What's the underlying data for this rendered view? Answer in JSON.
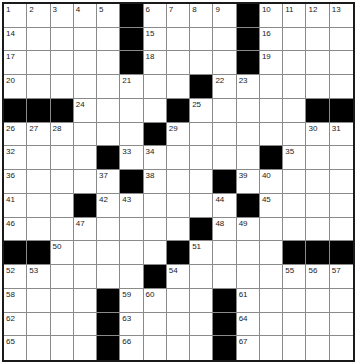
{
  "puzzle": {
    "size": 15,
    "colors": {
      "black": "#000000",
      "white": "#ffffff",
      "grid_line": "#8a8a8a",
      "border": "#1a1a1a"
    },
    "rows": [
      [
        "1",
        "2",
        "3",
        "4",
        "5",
        "#",
        "6",
        "7",
        "8",
        "9",
        "#",
        "10",
        "11",
        "12",
        "13"
      ],
      [
        "14",
        ".",
        ".",
        ".",
        ".",
        "#",
        "15",
        ".",
        ".",
        ".",
        "#",
        "16",
        ".",
        ".",
        "."
      ],
      [
        "17",
        ".",
        ".",
        ".",
        ".",
        "#",
        "18",
        ".",
        ".",
        ".",
        "#",
        "19",
        ".",
        ".",
        "."
      ],
      [
        "20",
        ".",
        ".",
        ".",
        ".",
        "21",
        ".",
        ".",
        "#",
        "22",
        "23",
        ".",
        ".",
        ".",
        "."
      ],
      [
        "#",
        "#",
        "#",
        "24",
        ".",
        ".",
        ".",
        "#",
        "25",
        ".",
        ".",
        ".",
        ".",
        "#",
        "#"
      ],
      [
        "26",
        "27",
        "28",
        ".",
        ".",
        ".",
        "#",
        "29",
        ".",
        ".",
        ".",
        ".",
        ".",
        "30",
        "31"
      ],
      [
        "32",
        ".",
        ".",
        ".",
        "#",
        "33",
        "34",
        ".",
        ".",
        ".",
        ".",
        "#",
        "35",
        ".",
        "."
      ],
      [
        "36",
        ".",
        ".",
        ".",
        "37",
        "#",
        "38",
        ".",
        ".",
        "#",
        "39",
        "40",
        ".",
        ".",
        "."
      ],
      [
        "41",
        ".",
        ".",
        "#",
        "42",
        "43",
        ".",
        ".",
        ".",
        "44",
        "#",
        "45",
        ".",
        ".",
        "."
      ],
      [
        "46",
        ".",
        ".",
        "47",
        ".",
        ".",
        ".",
        ".",
        "#",
        "48",
        "49",
        ".",
        ".",
        ".",
        "."
      ],
      [
        "#",
        "#",
        "50",
        ".",
        ".",
        ".",
        ".",
        "#",
        "51",
        ".",
        ".",
        ".",
        "#",
        "#",
        "#"
      ],
      [
        "52",
        "53",
        ".",
        ".",
        ".",
        ".",
        "#",
        "54",
        ".",
        ".",
        ".",
        ".",
        "55",
        "56",
        "57"
      ],
      [
        "58",
        ".",
        ".",
        ".",
        "#",
        "59",
        "60",
        ".",
        ".",
        "#",
        "61",
        ".",
        ".",
        ".",
        "."
      ],
      [
        "62",
        ".",
        ".",
        ".",
        "#",
        "63",
        ".",
        ".",
        ".",
        "#",
        "64",
        ".",
        ".",
        ".",
        "."
      ],
      [
        "65",
        ".",
        ".",
        ".",
        "#",
        "66",
        ".",
        ".",
        ".",
        "#",
        "67",
        ".",
        ".",
        ".",
        "."
      ]
    ]
  }
}
